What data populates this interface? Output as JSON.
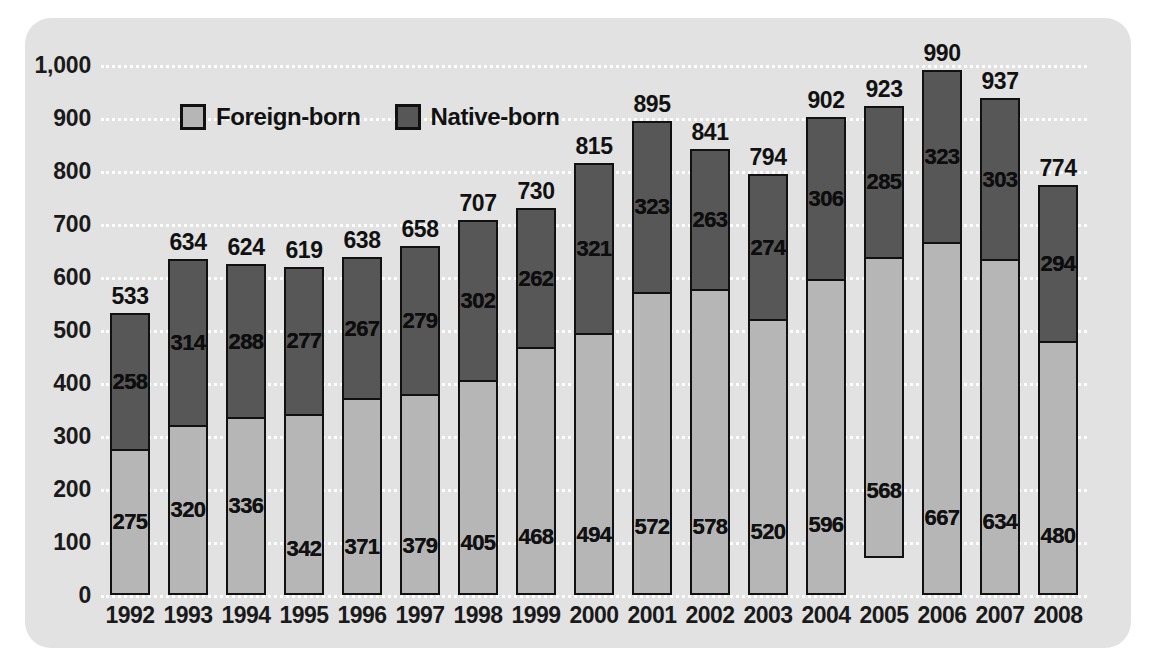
{
  "chart_data": {
    "type": "bar",
    "stacked": true,
    "title": "",
    "subtitle": "",
    "xlabel": "",
    "ylabel": "",
    "ylim": [
      0,
      1000
    ],
    "ytick_labels": [
      "0",
      "100",
      "200",
      "300",
      "400",
      "500",
      "600",
      "700",
      "800",
      "900",
      "1,000"
    ],
    "ytick_values": [
      0,
      100,
      200,
      300,
      400,
      500,
      600,
      700,
      800,
      900,
      1000
    ],
    "grid": "horizontal-dotted-white",
    "legend_position": "top-left-inside",
    "categories": [
      "1992",
      "1993",
      "1994",
      "1995",
      "1996",
      "1997",
      "1998",
      "1999",
      "2000",
      "2001",
      "2002",
      "2003",
      "2004",
      "2005",
      "2006",
      "2007",
      "2008"
    ],
    "series": [
      {
        "name": "Foreign-born",
        "color": "#b6b6b6",
        "values": [
          275,
          320,
          336,
          342,
          371,
          379,
          405,
          468,
          494,
          572,
          578,
          520,
          596,
          568,
          667,
          634,
          480
        ]
      },
      {
        "name": "Native-born",
        "color": "#575757",
        "values": [
          258,
          314,
          288,
          277,
          267,
          279,
          302,
          262,
          321,
          323,
          263,
          274,
          306,
          285,
          323,
          303,
          294
        ]
      }
    ],
    "totals": [
      533,
      634,
      624,
      619,
      638,
      658,
      707,
      730,
      815,
      895,
      841,
      794,
      902,
      923,
      990,
      937,
      774
    ]
  },
  "legend": {
    "items": [
      {
        "label": "Foreign-born",
        "swatch": "foreign"
      },
      {
        "label": "Native-born",
        "swatch": "native"
      }
    ]
  },
  "colors": {
    "panel_background": "#e2e2e2",
    "page_background": "#ffffff",
    "foreign_born": "#b6b6b6",
    "native_born": "#575757",
    "bar_outline": "#111111",
    "gridline": "#ffffff",
    "text": "#111111"
  }
}
